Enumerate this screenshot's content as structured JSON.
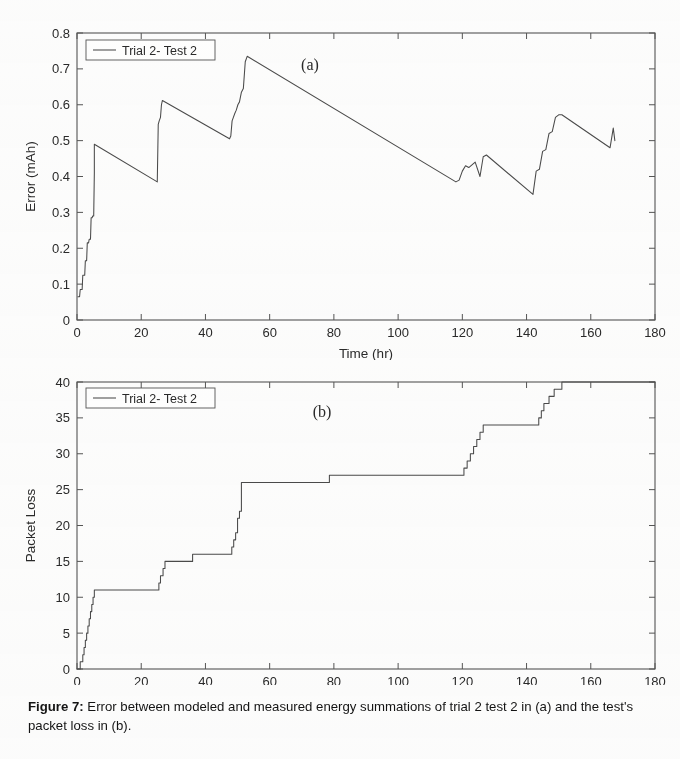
{
  "figure": {
    "label": "Figure 7:",
    "caption": "Error between modeled and measured energy summations of trial 2 test 2 in (a) and the test's packet loss in (b)."
  },
  "panels": {
    "a": {
      "letter": "(a)",
      "legend": "Trial 2- Test 2"
    },
    "b": {
      "letter": "(b)",
      "legend": "Trial 2- Test 2"
    }
  },
  "colors": {
    "line": "#4a4a4a",
    "axis": "#555555",
    "text": "#2a2a2a",
    "background": "#fdfdfd"
  },
  "chart_data": [
    {
      "type": "line",
      "title": "(a)",
      "xlabel": "Time (hr)",
      "ylabel": "Error (mAh)",
      "xlim": [
        0,
        180
      ],
      "ylim": [
        0,
        0.8
      ],
      "xticks": [
        0,
        20,
        40,
        60,
        80,
        100,
        120,
        140,
        160,
        180
      ],
      "yticks": [
        0,
        0.1,
        0.2,
        0.3,
        0.4,
        0.5,
        0.6,
        0.7,
        0.8
      ],
      "grid": false,
      "legend": [
        "Trial 2- Test 2"
      ],
      "legend_position": "upper left",
      "series": [
        {
          "name": "Trial 2- Test 2",
          "x": [
            0.3,
            0.8,
            1.0,
            1.6,
            1.8,
            2.4,
            2.6,
            3.0,
            3.2,
            3.6,
            3.8,
            4.2,
            4.4,
            4.7,
            4.9,
            5.2,
            5.4,
            25.0,
            25.3,
            25.6,
            26.0,
            26.3,
            26.6,
            47.5,
            47.9,
            48.3,
            48.7,
            49.1,
            49.6,
            50.1,
            50.6,
            51.2,
            51.8,
            52.4,
            53.0,
            118.0,
            119.0,
            120.0,
            121.0,
            122.0,
            124.0,
            125.5,
            126.5,
            127.5,
            142.0,
            143.0,
            144.0,
            145.0,
            146.0,
            147.0,
            148.0,
            149.0,
            150.0,
            151.0,
            166.0,
            167.0,
            167.5
          ],
          "y": [
            0.065,
            0.065,
            0.085,
            0.085,
            0.125,
            0.125,
            0.165,
            0.165,
            0.215,
            0.215,
            0.225,
            0.225,
            0.285,
            0.285,
            0.29,
            0.29,
            0.41,
            0.385,
            0.545,
            0.555,
            0.565,
            0.6,
            0.612,
            0.505,
            0.513,
            0.555,
            0.565,
            0.575,
            0.585,
            0.6,
            0.608,
            0.635,
            0.645,
            0.72,
            0.735,
            0.385,
            0.39,
            0.415,
            0.43,
            0.425,
            0.44,
            0.4,
            0.455,
            0.46,
            0.35,
            0.415,
            0.42,
            0.47,
            0.475,
            0.52,
            0.525,
            0.565,
            0.572,
            0.572,
            0.48,
            0.535,
            0.5
          ],
          "segments": [
            {
              "x": [
                5.4,
                25.0
              ],
              "y": [
                0.49,
                0.385
              ]
            },
            {
              "x": [
                26.6,
                47.5
              ],
              "y": [
                0.612,
                0.505
              ]
            },
            {
              "x": [
                53.0,
                118.0
              ],
              "y": [
                0.735,
                0.385
              ]
            },
            {
              "x": [
                127.5,
                142.0
              ],
              "y": [
                0.46,
                0.35
              ]
            },
            {
              "x": [
                151.0,
                166.0
              ],
              "y": [
                0.572,
                0.48
              ]
            }
          ],
          "peaks": [
            {
              "x": 5.4,
              "y": 0.49
            },
            {
              "x": 26.6,
              "y": 0.612
            },
            {
              "x": 53.0,
              "y": 0.735
            },
            {
              "x": 127.5,
              "y": 0.46
            },
            {
              "x": 151.0,
              "y": 0.572
            },
            {
              "x": 167.0,
              "y": 0.535
            }
          ],
          "troughs": [
            {
              "x": 0.3,
              "y": 0.065
            },
            {
              "x": 25.0,
              "y": 0.385
            },
            {
              "x": 47.5,
              "y": 0.505
            },
            {
              "x": 118.0,
              "y": 0.385
            },
            {
              "x": 142.0,
              "y": 0.35
            },
            {
              "x": 166.0,
              "y": 0.48
            }
          ]
        }
      ]
    },
    {
      "type": "line",
      "title": "(b)",
      "xlabel": "Time (hr)",
      "ylabel": "Packet Loss",
      "xlim": [
        0,
        180
      ],
      "ylim": [
        0,
        40
      ],
      "xticks": [
        0,
        20,
        40,
        60,
        80,
        100,
        120,
        140,
        160,
        180
      ],
      "yticks": [
        0,
        5,
        10,
        15,
        20,
        25,
        30,
        35,
        40
      ],
      "grid": false,
      "legend": [
        "Trial 2- Test 2"
      ],
      "legend_position": "upper left",
      "series": [
        {
          "name": "Trial 2- Test 2",
          "step": "post",
          "x": [
            0.0,
            1.0,
            1.4,
            1.8,
            2.2,
            2.6,
            3.0,
            3.4,
            3.8,
            4.2,
            4.6,
            5.0,
            5.4,
            25.0,
            25.5,
            26.0,
            26.8,
            27.4,
            28.0,
            35.5,
            36.0,
            47.5,
            48.2,
            48.8,
            49.4,
            50.0,
            50.6,
            51.2,
            78.0,
            78.6,
            119.5,
            120.5,
            121.5,
            122.5,
            123.5,
            124.5,
            125.5,
            126.5,
            143.0,
            143.8,
            144.6,
            145.4,
            146.2,
            147.0,
            147.8,
            148.6,
            149.4,
            150.2,
            151.0,
            166.5,
            167.5,
            180.0
          ],
          "y": [
            0,
            1,
            1,
            2,
            3,
            4,
            5,
            6,
            7,
            8,
            9,
            10,
            11,
            11,
            12,
            13,
            14,
            15,
            15,
            15,
            16,
            16,
            17,
            18,
            19,
            21,
            22,
            26,
            26,
            27,
            27,
            28,
            29,
            30,
            31,
            32,
            33,
            34,
            34,
            35,
            36,
            37,
            37,
            38,
            38,
            39,
            39,
            39,
            40,
            40,
            40,
            40
          ],
          "plateaus": [
            {
              "from": 5.4,
              "to": 25.0,
              "value": 11
            },
            {
              "from": 28.0,
              "to": 35.5,
              "value": 15
            },
            {
              "from": 36.0,
              "to": 47.5,
              "value": 16
            },
            {
              "from": 51.2,
              "to": 78.0,
              "value": 26
            },
            {
              "from": 78.6,
              "to": 119.5,
              "value": 27
            },
            {
              "from": 126.5,
              "to": 143.0,
              "value": 34
            },
            {
              "from": 151.0,
              "to": 180.0,
              "value": 40
            }
          ]
        }
      ]
    }
  ]
}
